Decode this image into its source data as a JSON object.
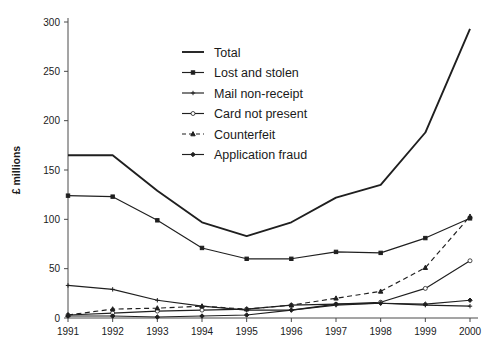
{
  "figure": {
    "ylabel": "£ millions",
    "background": "#ffffff",
    "ink": "#1f1f1f"
  },
  "yaxis": {
    "ticks": [
      "0",
      "50",
      "100",
      "150",
      "200",
      "250",
      "300"
    ]
  },
  "xaxis": {
    "ticks": [
      "1991",
      "1992",
      "1993",
      "1994",
      "1995",
      "1996",
      "1997",
      "1998",
      "1999",
      "2000"
    ]
  },
  "legend": {
    "items": [
      {
        "label": "Total",
        "marker": "none",
        "dash": "solid"
      },
      {
        "label": "Lost and stolen",
        "marker": "square",
        "dash": "solid"
      },
      {
        "label": "Mail non-receipt",
        "marker": "plus",
        "dash": "solid"
      },
      {
        "label": "Card not present",
        "marker": "circle-open",
        "dash": "solid"
      },
      {
        "label": "Counterfeit",
        "marker": "triangle",
        "dash": "dashed"
      },
      {
        "label": "Application fraud",
        "marker": "diamond",
        "dash": "solid"
      }
    ]
  },
  "chart_data": {
    "type": "line",
    "title": "",
    "xlabel": "",
    "ylabel": "£ millions",
    "x": [
      1991,
      1992,
      1993,
      1994,
      1995,
      1996,
      1997,
      1998,
      1999,
      2000
    ],
    "categories": [
      "1991",
      "1992",
      "1993",
      "1994",
      "1995",
      "1996",
      "1997",
      "1998",
      "1999",
      "2000"
    ],
    "xlim": [
      1991,
      2000
    ],
    "ylim": [
      0,
      300
    ],
    "ytick_step": 50,
    "grid": false,
    "legend_position": "upper-center-left",
    "series": [
      {
        "name": "Total",
        "marker": "none",
        "dash": "solid",
        "values": [
          165,
          165,
          129,
          97,
          83,
          97,
          122,
          135,
          188,
          293
        ]
      },
      {
        "name": "Lost and stolen",
        "marker": "square",
        "dash": "solid",
        "values": [
          124,
          123,
          99,
          71,
          60,
          60,
          67,
          66,
          81,
          101
        ]
      },
      {
        "name": "Mail non-receipt",
        "marker": "plus",
        "dash": "solid",
        "values": [
          33,
          29,
          18,
          12,
          8,
          8,
          13,
          15,
          13,
          12
        ]
      },
      {
        "name": "Card not present",
        "marker": "circle-open",
        "dash": "solid",
        "values": [
          3,
          5,
          7,
          8,
          9,
          13,
          14,
          16,
          30,
          58
        ]
      },
      {
        "name": "Counterfeit",
        "marker": "triangle",
        "dash": "dashed",
        "values": [
          3,
          9,
          10,
          12,
          9,
          13,
          20,
          27,
          51,
          103
        ]
      },
      {
        "name": "Application fraud",
        "marker": "diamond",
        "dash": "solid",
        "values": [
          2,
          2,
          1,
          2,
          3,
          8,
          14,
          15,
          14,
          18
        ]
      }
    ]
  }
}
